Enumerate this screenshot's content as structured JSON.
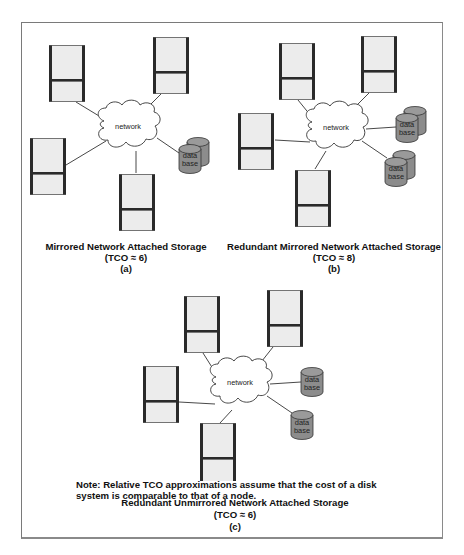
{
  "figure": {
    "panels": [
      {
        "id": "a",
        "title": "Mirrored Network Attached Storage",
        "tco": "(TCO ≈ 6)",
        "label": "(a)",
        "network_label": "network",
        "database_label_line1": "data",
        "database_label_line2": "base",
        "nodes": 4,
        "databases": [
          {
            "type": "mirrored"
          }
        ]
      },
      {
        "id": "b",
        "title": "Redundant Mirrored Network Attached Storage",
        "tco": "(TCO ≈ 8)",
        "label": "(b)",
        "network_label": "network",
        "database_label_line1": "data",
        "database_label_line2": "base",
        "nodes": 4,
        "databases": [
          {
            "type": "mirrored"
          },
          {
            "type": "mirrored"
          }
        ]
      },
      {
        "id": "c",
        "title": "Redundant Unmirrored Network Attached Storage",
        "tco": "(TCO ≈ 6)",
        "label": "(c)",
        "network_label": "network",
        "database_label_line1": "data",
        "database_label_line2": "base",
        "nodes": 4,
        "databases": [
          {
            "type": "single"
          },
          {
            "type": "single"
          }
        ]
      }
    ],
    "note_line1": "Note: Relative TCO approximations assume that the cost of a disk",
    "note_line2": "system is comparable to that of a node."
  },
  "colors": {
    "node_fill": "#ececec",
    "node_edge": "#2a2a2a",
    "database_fill": "#8c8c8c",
    "cloud_fill": "#ffffff",
    "line": "#333333"
  }
}
